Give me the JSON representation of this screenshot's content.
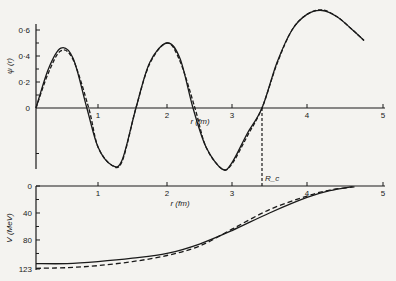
{
  "chart_data": [
    {
      "type": "line",
      "ylabel": "ψ (r)",
      "xlabel": "r (fm)",
      "x_ticks": [
        "1",
        "2",
        "3",
        "4",
        "5"
      ],
      "y_ticks": [
        "0",
        "0·2",
        "0·4",
        "0·6"
      ],
      "xlim": [
        0,
        5
      ],
      "ylim": [
        -0.47,
        0.65
      ],
      "annotation": "R_c",
      "annotation_r": 3.4,
      "series": [
        {
          "name": "solid",
          "style": "solid",
          "x": [
            0,
            0.2,
            0.4,
            0.6,
            0.82,
            1.0,
            1.2,
            1.35,
            1.55,
            1.75,
            2.0,
            2.2,
            2.4,
            2.6,
            2.85,
            3.0,
            3.2,
            3.4,
            3.6,
            3.8,
            4.0,
            4.2,
            4.4,
            4.6,
            4.75
          ],
          "y": [
            0,
            0.3,
            0.46,
            0.38,
            0,
            -0.3,
            -0.44,
            -0.4,
            0,
            0.35,
            0.5,
            0.38,
            0,
            -0.3,
            -0.47,
            -0.42,
            -0.2,
            0,
            0.35,
            0.6,
            0.72,
            0.75,
            0.7,
            0.6,
            0.52
          ]
        },
        {
          "name": "dashed",
          "style": "dashed",
          "x": [
            0,
            0.2,
            0.4,
            0.6,
            0.85,
            1.0,
            1.2,
            1.35,
            1.55,
            1.75,
            2.0,
            2.2,
            2.43,
            2.6,
            2.85,
            3.0,
            3.2,
            3.4,
            3.6,
            3.8,
            4.0,
            4.2,
            4.4,
            4.6,
            4.75
          ],
          "y": [
            0,
            0.27,
            0.44,
            0.37,
            0,
            -0.3,
            -0.44,
            -0.41,
            0,
            0.34,
            0.5,
            0.36,
            0,
            -0.3,
            -0.47,
            -0.43,
            -0.22,
            0,
            0.34,
            0.6,
            0.72,
            0.755,
            0.7,
            0.6,
            0.52
          ]
        }
      ]
    },
    {
      "type": "line",
      "ylabel": "V (MeV)",
      "xlabel": "r (fm)",
      "x_ticks": [
        "1",
        "2",
        "3",
        "4",
        "5"
      ],
      "y_ticks": [
        "0",
        "40",
        "80",
        "123"
      ],
      "xlim": [
        0,
        5
      ],
      "ylim": [
        0,
        123
      ],
      "series": [
        {
          "name": "solid",
          "style": "solid",
          "x": [
            0,
            0.5,
            1.0,
            1.5,
            2.0,
            2.5,
            3.0,
            3.5,
            4.0,
            4.3,
            4.6
          ],
          "y": [
            115,
            115,
            112,
            107,
            100,
            86,
            66,
            40,
            17,
            7,
            1
          ]
        },
        {
          "name": "dashed",
          "style": "dashed",
          "x": [
            0,
            0.5,
            1.0,
            1.5,
            2.0,
            2.5,
            3.0,
            3.5,
            4.0,
            4.3,
            4.65
          ],
          "y": [
            122,
            121,
            118,
            112,
            103,
            89,
            64,
            35,
            15,
            6,
            1
          ]
        }
      ]
    }
  ]
}
